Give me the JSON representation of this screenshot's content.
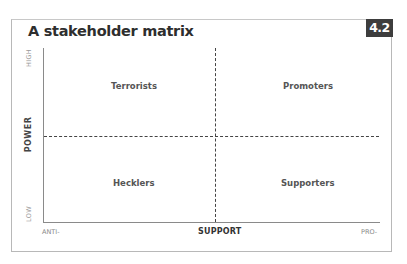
{
  "figure": {
    "title": "A stakeholder matrix",
    "badge": "4.2"
  },
  "axes": {
    "y_label": "POWER",
    "y_high": "HIGH",
    "y_low": "LOW",
    "x_label": "SUPPORT",
    "x_low": "ANTI-",
    "x_high": "PRO-"
  },
  "quadrants": {
    "top_left": "Terrorists",
    "top_right": "Promoters",
    "bottom_left": "Hecklers",
    "bottom_right": "Supporters"
  },
  "colors": {
    "badge_bg": "#3d3d3d",
    "lines": "#444444",
    "frame": "#b8b8b8"
  }
}
